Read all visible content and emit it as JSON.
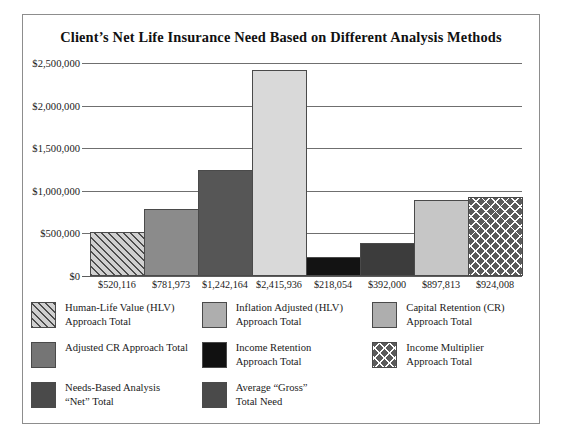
{
  "chart_data": {
    "type": "bar",
    "title": "Client’s Net Life Insurance Need Based on Different Analysis Methods",
    "xlabel": "",
    "ylabel": "",
    "ylim": [
      0,
      2500000
    ],
    "grid": true,
    "legend_position": "bottom",
    "categories": [
      "$520,116",
      "$781,973",
      "$1,242,164",
      "$2,415,936",
      "$218,054",
      "$392,000",
      "$897,813",
      "$924,008"
    ],
    "values": [
      520116,
      781973,
      1242164,
      2415936,
      218054,
      392000,
      897813,
      924008
    ],
    "y_ticks": [
      "$0",
      "$500,000",
      "$1,000,000",
      "$1,500,000",
      "$2,000,000",
      "$2,500,000"
    ],
    "y_tick_values": [
      0,
      500000,
      1000000,
      1500000,
      2000000,
      2500000
    ],
    "series": [
      {
        "name": "Human-Life Value (HLV) Approach Total",
        "value": 520116,
        "label": "$520,116",
        "fill": "diagonal-hatch",
        "color": "#d0d0d0"
      },
      {
        "name": "Inflation Adjusted (HLV) Approach Total",
        "value": 781973,
        "label": "$781,973",
        "fill": "solid",
        "color": "#8b8b8b"
      },
      {
        "name": "Capital Retention (CR) Approach Total",
        "value": 1242164,
        "label": "$1,242,164",
        "fill": "solid",
        "color": "#565656"
      },
      {
        "name": "Adjusted CR Approach Total",
        "value": 2415936,
        "label": "$2,415,936",
        "fill": "solid",
        "color": "#d9d9d9"
      },
      {
        "name": "Income Retention Approach Total",
        "value": 218054,
        "label": "$218,054",
        "fill": "solid",
        "color": "#131313"
      },
      {
        "name": "Needs-Based Analysis “Net” Total",
        "value": 392000,
        "label": "$392,000",
        "fill": "solid",
        "color": "#3c3c3c"
      },
      {
        "name": "Average “Gross” Total Need",
        "value": 897813,
        "label": "$897,813",
        "fill": "solid",
        "color": "#c6c6c6"
      },
      {
        "name": "Income Multiplier Approach Total",
        "value": 924008,
        "label": "$924,008",
        "fill": "x-marks",
        "color": "#5b5b5b"
      }
    ]
  },
  "legend": {
    "rows": [
      [
        {
          "line1": "Human-Life Value (HLV)",
          "line2": "Approach Total",
          "swatch": "diagonal-hatch"
        },
        {
          "line1": "Inflation Adjusted (HLV)",
          "line2": "Approach Total",
          "swatch": "solid-light-gray"
        },
        {
          "line1": "Capital Retention (CR)",
          "line2": "Approach Total",
          "swatch": "solid-light-gray"
        }
      ],
      [
        {
          "line1": "Adjusted CR Approach Total",
          "line2": "",
          "swatch": "solid-mid-gray"
        },
        {
          "line1": "Income Retention",
          "line2": "Approach Total",
          "swatch": "solid-black"
        },
        {
          "line1": "Income Multiplier",
          "line2": "Approach Total",
          "swatch": "x-marks"
        }
      ],
      [
        {
          "line1": "Needs-Based Analysis",
          "line2": "“Net” Total",
          "swatch": "solid-dark-gray"
        },
        {
          "line1": "Average “Gross”",
          "line2": "Total Need",
          "swatch": "solid-dark-gray"
        },
        {
          "line1": "",
          "line2": "",
          "swatch": "none"
        }
      ]
    ],
    "swatch_colors": {
      "solid-light-gray": "#aeaeae",
      "solid-mid-gray": "#757575",
      "solid-dark-gray": "#4a4a4a",
      "solid-black": "#111111",
      "diagonal-hatch": "#d0d0d0",
      "x-marks": "#5b5b5b"
    }
  },
  "frame": {
    "border_color": "#8d8d8d",
    "background": "#ffffff"
  }
}
